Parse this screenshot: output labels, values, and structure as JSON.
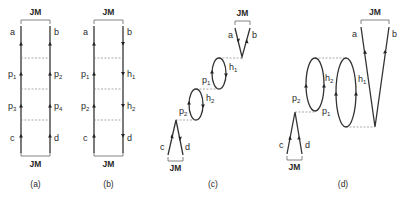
{
  "figure": {
    "panels": [
      {
        "id": "a",
        "caption": "(a)",
        "top_bracket": "JM",
        "bottom_bracket": "JM",
        "left_labels": [
          "a",
          "p",
          "p",
          "c"
        ],
        "left_subs": [
          "",
          "1",
          "3",
          ""
        ],
        "right_labels": [
          "b",
          "p",
          "p",
          "d"
        ],
        "right_subs": [
          "",
          "2",
          "4",
          ""
        ],
        "arrow_direction_left": "up",
        "arrow_direction_right": "up"
      },
      {
        "id": "b",
        "caption": "(b)",
        "top_bracket": "JM",
        "bottom_bracket": "JM",
        "left_labels": [
          "a",
          "p",
          "p",
          "c"
        ],
        "left_subs": [
          "",
          "1",
          "2",
          ""
        ],
        "right_labels": [
          "b",
          "h",
          "h",
          "d"
        ],
        "right_subs": [
          "",
          "1",
          "2",
          ""
        ],
        "arrow_direction_left": "up",
        "arrow_direction_right": "down"
      },
      {
        "id": "c",
        "caption": "(c)",
        "top_bracket": "JM",
        "bottom_bracket": "JM",
        "labels": {
          "a": "a",
          "b": "b",
          "c": "c",
          "d": "d",
          "p1": "p",
          "p1_sub": "1",
          "h1": "h",
          "h1_sub": "1",
          "p2": "p",
          "p2_sub": "2",
          "h2": "h",
          "h2_sub": "2"
        }
      },
      {
        "id": "d",
        "caption": "(d)",
        "top_bracket": "JM",
        "bottom_bracket": "JM",
        "labels": {
          "a": "a",
          "b": "b",
          "c": "c",
          "d": "d",
          "p1": "p",
          "p1_sub": "1",
          "h1": "h",
          "h1_sub": "1",
          "p2": "p",
          "p2_sub": "2",
          "h2": "h",
          "h2_sub": "2"
        }
      }
    ]
  }
}
